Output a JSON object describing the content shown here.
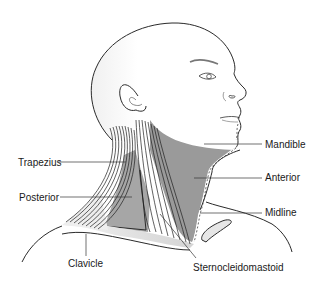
{
  "figure": {
    "colors": {
      "background": "#ffffff",
      "skin_outline": "#2a2a2a",
      "anterior_region_fill": "#9a9a9a",
      "posterior_region_fill": "#a6a6a6",
      "clavicle_fill": "#e4e4e4",
      "muscle_lines": "#1e1e1e",
      "leader_lines": "#333333"
    }
  },
  "labels": {
    "trapezius": "Trapezius",
    "posterior": "Posterior",
    "mandible": "Mandible",
    "anterior": "Anterior",
    "midline": "Midline",
    "clavicle": "Clavicle",
    "sternocleidomastoid": "Sternocleidomastoid"
  }
}
